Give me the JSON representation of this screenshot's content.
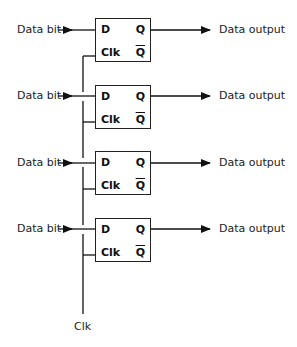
{
  "diagram": {
    "type": "parallel-register-d-flip-flops",
    "flip_flops": [
      {
        "input_label": "Data bit",
        "output_label": "Data output",
        "pins": {
          "d": "D",
          "clk": "Clk",
          "q": "Q",
          "qbar": "Q"
        }
      },
      {
        "input_label": "Data bit",
        "output_label": "Data output",
        "pins": {
          "d": "D",
          "clk": "Clk",
          "q": "Q",
          "qbar": "Q"
        }
      },
      {
        "input_label": "Data bit",
        "output_label": "Data output",
        "pins": {
          "d": "D",
          "clk": "Clk",
          "q": "Q",
          "qbar": "Q"
        }
      },
      {
        "input_label": "Data bit",
        "output_label": "Data output",
        "pins": {
          "d": "D",
          "clk": "Clk",
          "q": "Q",
          "qbar": "Q"
        }
      }
    ],
    "clock_label": "Clk",
    "colors": {
      "line": "#111111",
      "text": "#222222",
      "background": "#ffffff"
    }
  }
}
